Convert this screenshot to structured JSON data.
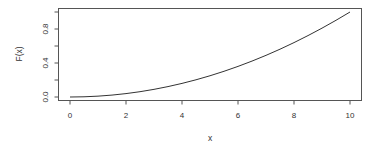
{
  "chart_data": {
    "type": "line",
    "title": "",
    "xlabel": "x",
    "ylabel": "F(x)",
    "xlim": [
      0,
      10
    ],
    "ylim": [
      0,
      1
    ],
    "grid": false,
    "legend": "none",
    "x_ticks": [
      0,
      2,
      4,
      6,
      8,
      10
    ],
    "x_tick_labels": [
      "0",
      "2",
      "4",
      "6",
      "8",
      "10"
    ],
    "y_ticks": [
      0.0,
      0.2,
      0.4,
      0.6,
      0.8,
      1.0
    ],
    "y_tick_labels": [
      "0.0",
      "",
      "0.4",
      "",
      "0.8",
      ""
    ],
    "series": [
      {
        "name": "F(x)",
        "color": "#333333",
        "x": [
          0,
          0.5,
          1,
          1.5,
          2,
          2.5,
          3,
          3.5,
          4,
          4.5,
          5,
          5.5,
          6,
          6.5,
          7,
          7.5,
          8,
          8.5,
          9,
          9.5,
          10
        ],
        "y": [
          0,
          0.0025,
          0.01,
          0.0225,
          0.04,
          0.0625,
          0.09,
          0.1225,
          0.16,
          0.2025,
          0.25,
          0.3025,
          0.36,
          0.4225,
          0.49,
          0.5625,
          0.64,
          0.7225,
          0.81,
          0.9025,
          1.0
        ]
      }
    ]
  }
}
